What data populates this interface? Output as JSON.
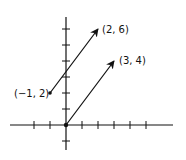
{
  "diagram": {
    "type": "vector-plot",
    "origin_px": [
      66,
      125
    ],
    "unit_px": 16,
    "x_ticks": [
      -2,
      -1,
      1,
      2,
      3,
      4,
      5
    ],
    "y_ticks": [
      -1,
      1,
      2,
      3,
      4,
      5,
      6
    ],
    "vectors": [
      {
        "name": "vector-from-neg1-2-to-2-6",
        "from": [
          -1,
          2
        ],
        "to": [
          2,
          6
        ],
        "from_label": "(-1, 2)",
        "to_label": "(2, 6)"
      },
      {
        "name": "vector-from-origin-to-3-4",
        "from": [
          0,
          0
        ],
        "to": [
          3,
          4
        ],
        "from_label": "",
        "to_label": "(3, 4)"
      }
    ],
    "colors": {
      "ink": "#111111",
      "background": "#ffffff"
    }
  },
  "labels": {
    "p_neg1_2": "(−1, 2)",
    "p_2_6": "(2, 6)",
    "p_3_4": "(3, 4)"
  }
}
